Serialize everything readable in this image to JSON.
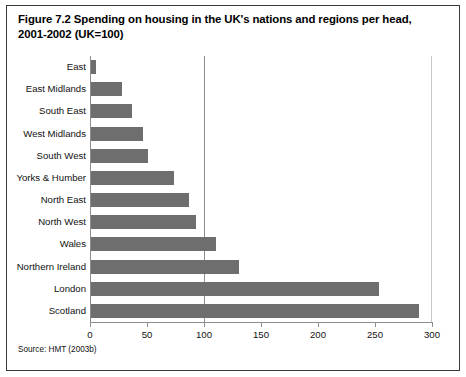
{
  "figure": {
    "title": "Figure 7.2 Spending on housing in the UK's nations and regions per head, 2001-2002 (UK=100)",
    "source": "Source: HMT (2003b)",
    "bar_color": "#6e6e6e",
    "axis_color": "#8d8d8d",
    "text_color": "#111111"
  },
  "chart_data": {
    "type": "bar",
    "orientation": "horizontal",
    "title": "Figure 7.2 Spending on housing in the UK's nations and regions per head, 2001-2002 (UK=100)",
    "xlabel": "",
    "ylabel": "",
    "xlim": [
      0,
      300
    ],
    "xticks": [
      0,
      50,
      100,
      150,
      200,
      250,
      300
    ],
    "xtick_labels": [
      "0",
      "50",
      "100",
      "150",
      "200",
      "250",
      "300"
    ],
    "grid": "vertical gridline at 100 (UK=100 reference)",
    "reference_line": 100,
    "legend": "none",
    "categories": [
      "East",
      "East Midlands",
      "South East",
      "West Midlands",
      "South West",
      "Yorks & Humber",
      "North East",
      "North West",
      "Wales",
      "Northern Ireland",
      "London",
      "Scotland"
    ],
    "values": [
      4,
      27,
      36,
      46,
      50,
      73,
      86,
      92,
      110,
      130,
      253,
      288
    ]
  }
}
